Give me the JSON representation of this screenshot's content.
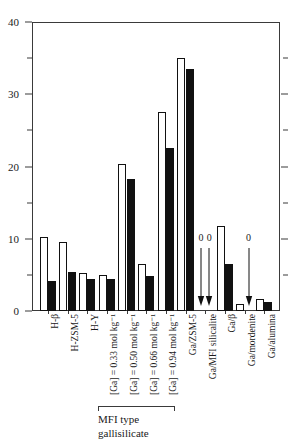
{
  "top_caption_fragment": "",
  "chart_data": {
    "type": "bar",
    "title": "",
    "subtitle": "",
    "xlabel": "",
    "ylabel": "",
    "ylim": [
      0,
      40
    ],
    "y_major_ticks": [
      0,
      10,
      20,
      30,
      40
    ],
    "y_minor_ticks": [
      5,
      15,
      25,
      35
    ],
    "grid": false,
    "legend_position": "none",
    "categories": [
      "H-β",
      "H-ZSM-5",
      "H-Y",
      "[Ga] = 0.33 mol kg⁻¹",
      "[Ga] = 0.50 mol kg⁻¹",
      "[Ga] = 0.66 mol kg⁻¹",
      "[Ga] = 0.94 mol kg⁻¹",
      "Ga/ZSM-5",
      "Ga/MFI silicalite",
      "Ga/β",
      "Ga/mordenite",
      "Ga/alumina"
    ],
    "series": [
      {
        "name": "open",
        "style": "open",
        "values": [
          10.2,
          9.6,
          5.2,
          5.0,
          20.3,
          6.5,
          27.5,
          35.0,
          0,
          11.7,
          1.0,
          1.6
        ]
      },
      {
        "name": "solid",
        "style": "solid",
        "values": [
          4.2,
          5.4,
          4.4,
          4.5,
          18.3,
          4.8,
          22.5,
          33.5,
          0,
          6.5,
          0,
          1.3
        ]
      }
    ],
    "zero_annotations": [
      {
        "label": "0",
        "category": "Ga/MFI silicalite",
        "series": "open"
      },
      {
        "label": "0",
        "category": "Ga/MFI silicalite",
        "series": "solid"
      },
      {
        "label": "0",
        "category": "Ga/mordenite",
        "series": "solid"
      }
    ],
    "group_bracket": {
      "covers": [
        "[Ga] = 0.33 mol kg⁻¹",
        "[Ga] = 0.50 mol kg⁻¹",
        "[Ga] = 0.66 mol kg⁻¹",
        "[Ga] = 0.94 mol kg⁻¹"
      ],
      "caption_line1": "MFI type",
      "caption_line2": "gallisilicate"
    }
  }
}
